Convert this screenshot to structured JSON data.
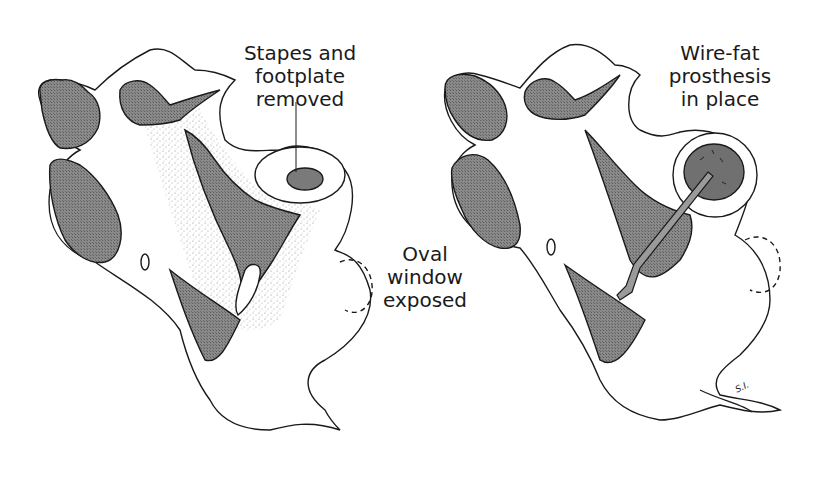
{
  "figure": {
    "panels": [
      {
        "id": "left",
        "caption_lines": [
          "Stapes and",
          "footplate",
          "removed"
        ],
        "secondary_caption_lines": [
          "Oval",
          "window",
          "exposed"
        ]
      },
      {
        "id": "right",
        "caption_lines": [
          "Wire-fat",
          "prosthesis",
          "in place"
        ]
      }
    ],
    "artist_signature": "S.I."
  },
  "colors": {
    "background": "#ffffff",
    "ink": "#1a1a1a",
    "bone_fill": "#7a7a7a",
    "stipple": "#555555"
  }
}
